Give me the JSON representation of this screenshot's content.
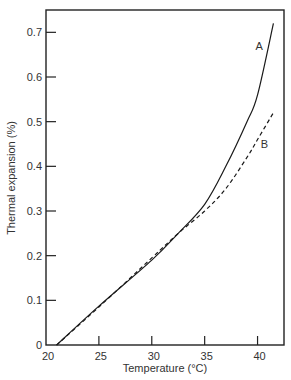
{
  "chart_data": {
    "type": "line",
    "title": "",
    "xlabel": "Temperature (°C)",
    "ylabel": "Thermal expansion (%)",
    "xlim": [
      20,
      42.5
    ],
    "ylim": [
      0,
      0.75
    ],
    "x_ticks": [
      20,
      25,
      30,
      35,
      40
    ],
    "x_tick_labels": [
      "20",
      "25",
      "30",
      "35",
      "40"
    ],
    "y_ticks": [
      0,
      0.1,
      0.2,
      0.3,
      0.4,
      0.5,
      0.6,
      0.7
    ],
    "y_tick_labels": [
      "0",
      "0.1",
      "0.2",
      "0.3",
      "0.4",
      "0.5",
      "0.6",
      "0.7"
    ],
    "grid": false,
    "legend": "inline labels",
    "series": [
      {
        "name": "A",
        "style": "solid",
        "x": [
          21,
          25,
          30,
          32.5,
          35,
          37,
          39,
          40,
          41.5
        ],
        "values": [
          0,
          0.087,
          0.19,
          0.25,
          0.315,
          0.4,
          0.5,
          0.56,
          0.72
        ]
      },
      {
        "name": "B",
        "style": "dashed",
        "x": [
          21,
          25,
          30,
          32.5,
          35,
          37,
          39,
          40,
          41.5
        ],
        "values": [
          0,
          0.085,
          0.195,
          0.25,
          0.3,
          0.35,
          0.42,
          0.46,
          0.52
        ]
      }
    ],
    "annotations": [
      {
        "text": "A",
        "x": 39.8,
        "y": 0.66
      },
      {
        "text": "B",
        "x": 40.3,
        "y": 0.44
      }
    ]
  },
  "plot": {
    "left": 46,
    "right": 284,
    "top": 10,
    "bottom": 345,
    "colors": {
      "axis": "#222222",
      "curve": "#1a1a1a",
      "text": "#333333"
    }
  }
}
